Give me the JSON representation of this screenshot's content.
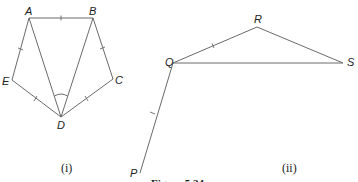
{
  "figure": {
    "caption": "Figure 5.24",
    "parts": [
      {
        "label": "(i)",
        "points": {
          "A": {
            "name": "A",
            "x": 29,
            "y": 18
          },
          "B": {
            "name": "B",
            "x": 93,
            "y": 18
          },
          "C": {
            "name": "C",
            "x": 113,
            "y": 79
          },
          "D": {
            "name": "D",
            "x": 61,
            "y": 117
          },
          "E": {
            "name": "E",
            "x": 12,
            "y": 80
          }
        },
        "segments": [
          "AB",
          "AE",
          "ED",
          "AD",
          "BD",
          "BC",
          "CD"
        ],
        "equal_marks": [
          "AB",
          "AE",
          "BC",
          "ED",
          "CD"
        ],
        "angle_mark": "ADB"
      },
      {
        "label": "(ii)",
        "points": {
          "P": {
            "name": "P",
            "x": 140,
            "y": 173
          },
          "Q": {
            "name": "Q",
            "x": 173,
            "y": 63
          },
          "R": {
            "name": "R",
            "x": 257,
            "y": 27
          },
          "S": {
            "name": "S",
            "x": 343,
            "y": 63
          }
        },
        "segments": [
          "PQ",
          "QR",
          "RS",
          "QS"
        ],
        "equal_marks": [
          "PQ",
          "QR"
        ]
      }
    ]
  }
}
